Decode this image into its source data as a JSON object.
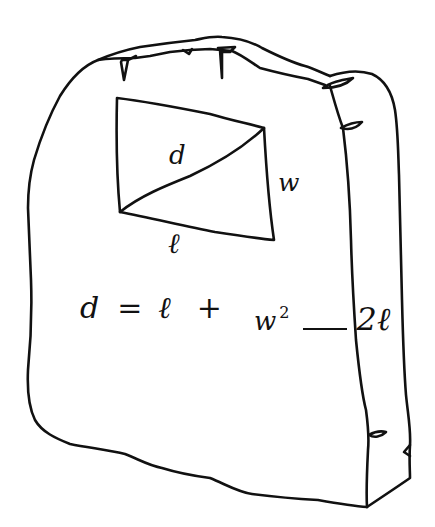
{
  "diagram": {
    "line_color": "#111111",
    "background": "#ffffff",
    "rectangle_labels": {
      "diagonal": "d",
      "width": "w",
      "length": "ℓ"
    },
    "formula": {
      "lhs": "d",
      "equals": "=",
      "term1": "ℓ",
      "plus": "+",
      "numerator": "w",
      "exponent": "2",
      "denominator": "2ℓ",
      "full_text": "d = ℓ + w²/(2ℓ)"
    }
  }
}
